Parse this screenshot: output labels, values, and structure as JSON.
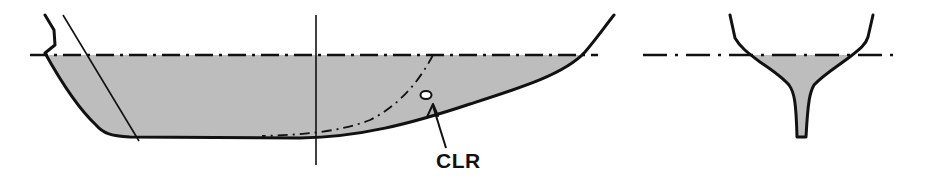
{
  "figure": {
    "type": "hull profile and midship section diagram",
    "views": [
      "side-profile",
      "cross-section"
    ],
    "colors": {
      "underwater_fill": "#bdbdbd",
      "line": "#111111",
      "background": "#ffffff"
    }
  },
  "profile_view": {
    "elements": [
      "waterline (dash-dot)",
      "hull outline",
      "underwater area (shaded)",
      "raked line",
      "vertical reference line",
      "dash-dot curve",
      "center of lateral resistance marker"
    ]
  },
  "labels": {
    "clr": "CLR"
  },
  "section_view": {
    "elements": [
      "waterline (dash-dot)",
      "hull section outline with fin keel",
      "underwater area (shaded)"
    ]
  }
}
